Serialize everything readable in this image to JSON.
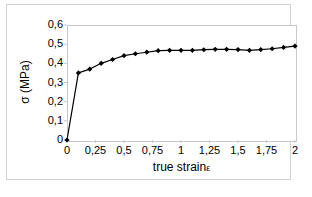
{
  "chart_data": {
    "type": "line",
    "title": "",
    "xlabel": "true strain ε",
    "ylabel": "σ (MPa)",
    "xlim": [
      0,
      2
    ],
    "ylim": [
      0,
      0.6
    ],
    "grid": false,
    "legend": null,
    "marker": "filled-diamond",
    "line_color": "#000000",
    "marker_color": "#000000",
    "xtick_labels": [
      "0",
      "0,25",
      "0,5",
      "0,75",
      "1",
      "1,25",
      "1,5",
      "1,75",
      "2"
    ],
    "xtick_values": [
      0,
      0.25,
      0.5,
      0.75,
      1,
      1.25,
      1.5,
      1.75,
      2
    ],
    "ytick_labels": [
      "0",
      "0,1",
      "0,2",
      "0,3",
      "0,4",
      "0,5",
      "0,6"
    ],
    "ytick_values": [
      0,
      0.1,
      0.2,
      0.3,
      0.4,
      0.5,
      0.6
    ],
    "x": [
      0,
      0.1,
      0.2,
      0.3,
      0.4,
      0.5,
      0.6,
      0.7,
      0.8,
      0.9,
      1.0,
      1.1,
      1.2,
      1.3,
      1.4,
      1.5,
      1.6,
      1.7,
      1.8,
      1.9,
      2.0
    ],
    "y": [
      0.0,
      0.35,
      0.37,
      0.4,
      0.42,
      0.44,
      0.45,
      0.458,
      0.466,
      0.468,
      0.468,
      0.468,
      0.471,
      0.473,
      0.473,
      0.472,
      0.468,
      0.472,
      0.476,
      0.483,
      0.49
    ],
    "series": [
      {
        "name": "true stress-strain",
        "x": [
          0,
          0.1,
          0.2,
          0.3,
          0.4,
          0.5,
          0.6,
          0.7,
          0.8,
          0.9,
          1.0,
          1.1,
          1.2,
          1.3,
          1.4,
          1.5,
          1.6,
          1.7,
          1.8,
          1.9,
          2.0
        ],
        "values": [
          0.0,
          0.35,
          0.37,
          0.4,
          0.42,
          0.44,
          0.45,
          0.458,
          0.466,
          0.468,
          0.468,
          0.468,
          0.471,
          0.473,
          0.473,
          0.472,
          0.468,
          0.472,
          0.476,
          0.483,
          0.49
        ]
      }
    ]
  },
  "axes": {
    "x_title_main": "true strain",
    "x_title_symbol": "ε",
    "y_title": "σ (MPa)"
  },
  "colors": {
    "frame": "#d2d2d2",
    "plot_border": "#c8c8c8",
    "data": "#000000",
    "background": "#ffffff"
  }
}
